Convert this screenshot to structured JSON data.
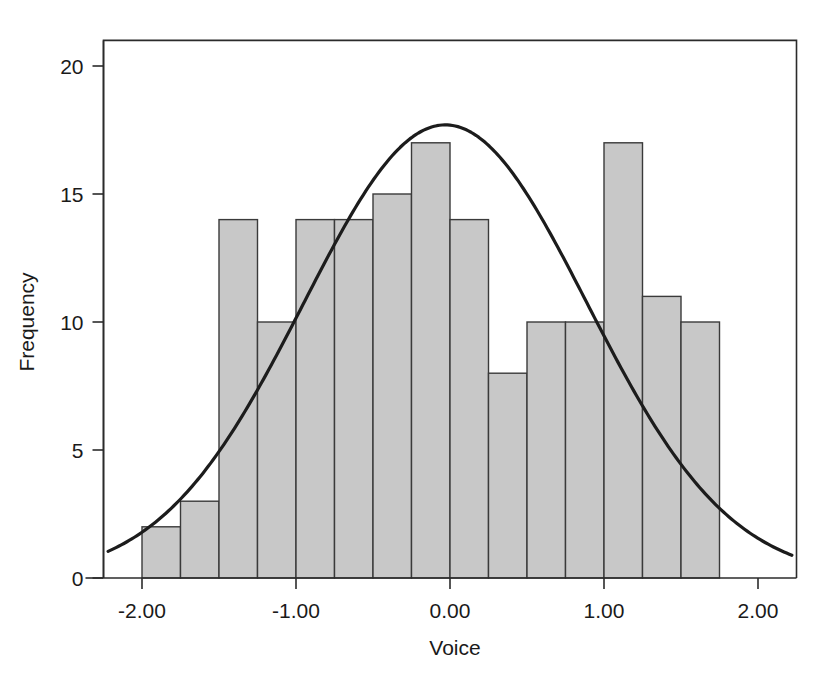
{
  "figure": {
    "background_color": "#ffffff",
    "width": 826,
    "height": 674
  },
  "chart_data": {
    "type": "bar",
    "title": "",
    "subtitle": "",
    "xlabel": "Voice",
    "ylabel": "Frequency",
    "xlim": [
      -2.25,
      2.25
    ],
    "ylim": [
      0,
      21
    ],
    "grid": false,
    "legend": null,
    "bar_colors": {
      "fill": "#c8c8c8",
      "edge": "#3a3a3a"
    },
    "curve_color": "#1c1c1c",
    "axis_color": "#2b2b2b",
    "bin_width": 0.25,
    "x_ticks": [
      -2.0,
      -1.0,
      0.0,
      1.0,
      2.0
    ],
    "x_tick_labels": [
      "-2.00",
      "-1.00",
      "0.00",
      "1.00",
      "2.00"
    ],
    "y_ticks": [
      0,
      5,
      10,
      15,
      20
    ],
    "y_tick_labels": [
      "0",
      "5",
      "10",
      "15",
      "20"
    ],
    "bins": [
      {
        "left": -2.0,
        "right": -1.75,
        "value": 2
      },
      {
        "left": -1.75,
        "right": -1.5,
        "value": 3
      },
      {
        "left": -1.5,
        "right": -1.25,
        "value": 14
      },
      {
        "left": -1.25,
        "right": -1.0,
        "value": 10
      },
      {
        "left": -1.0,
        "right": -0.75,
        "value": 14
      },
      {
        "left": -0.75,
        "right": -0.5,
        "value": 14
      },
      {
        "left": -0.5,
        "right": -0.25,
        "value": 15
      },
      {
        "left": -0.25,
        "right": 0.0,
        "value": 17
      },
      {
        "left": 0.0,
        "right": 0.25,
        "value": 14
      },
      {
        "left": 0.25,
        "right": 0.5,
        "value": 8
      },
      {
        "left": 0.5,
        "right": 0.75,
        "value": 10
      },
      {
        "left": 0.75,
        "right": 1.0,
        "value": 10
      },
      {
        "left": 1.0,
        "right": 1.25,
        "value": 17
      },
      {
        "left": 1.25,
        "right": 1.5,
        "value": 11
      },
      {
        "left": 1.5,
        "right": 1.75,
        "value": 10
      }
    ],
    "categories": [
      "-2.00",
      "-1.75",
      "-1.50",
      "-1.25",
      "-1.00",
      "-0.75",
      "-0.50",
      "-0.25",
      "0.00",
      "0.25",
      "0.50",
      "0.75",
      "1.00",
      "1.25",
      "1.50"
    ],
    "values": [
      2,
      3,
      14,
      10,
      14,
      14,
      15,
      17,
      14,
      8,
      10,
      10,
      17,
      11,
      10
    ],
    "overlay_curve": {
      "kind": "normal",
      "mean": -0.03,
      "std_dev": 0.92,
      "peak_value": 17.7,
      "x_start": -2.22,
      "x_end": 2.22
    }
  }
}
